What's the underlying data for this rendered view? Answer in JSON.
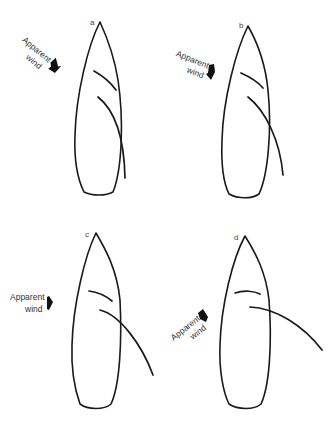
{
  "figure": {
    "colors": {
      "line": "#1a1a1a",
      "text": "#333333",
      "background": "#ffffff"
    },
    "panels": [
      {
        "id": "a",
        "label": "a",
        "wind_label_line1": "Apparent",
        "wind_label_line2": "wind",
        "wind_direction": "from upper-left, ~45° off bow"
      },
      {
        "id": "b",
        "label": "b",
        "wind_label_line1": "Apparent",
        "wind_label_line2": "wind",
        "wind_direction": "from left-forward, ~60° off bow"
      },
      {
        "id": "c",
        "label": "c",
        "wind_label_line1": "Apparent",
        "wind_label_line2": "wind",
        "wind_direction": "abeam, from left"
      },
      {
        "id": "d",
        "label": "d",
        "wind_label_line1": "Apparent",
        "wind_label_line2": "wind",
        "wind_direction": "from aft-left quarter"
      }
    ]
  }
}
